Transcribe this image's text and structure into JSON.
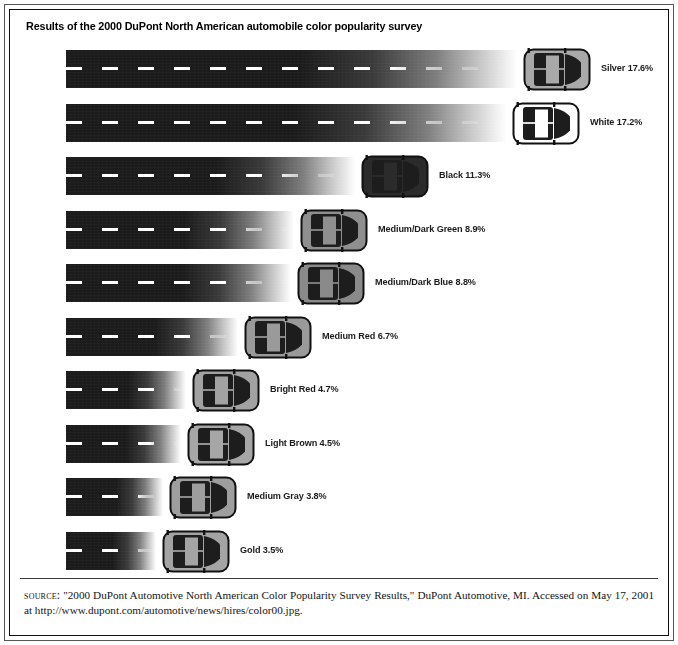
{
  "figure": {
    "title": "Results of the 2000 DuPont North American automobile color popularity survey",
    "source_prefix": "source:",
    "source_text": " \"2000 DuPont Automotive North American Color Popularity Survey Results,\" DuPont Automotive, MI. Accessed on May 17, 2001 at http://www.dupont.com/automotive/news/hires/color00.jpg."
  },
  "chart_data": {
    "type": "bar",
    "title": "Results of the 2000 DuPont North American automobile color popularity survey",
    "xlabel": "",
    "ylabel": "",
    "xlim": [
      0,
      18
    ],
    "grid": false,
    "legend": "none",
    "orientation": "horizontal",
    "unit": "%",
    "categories": [
      "Silver",
      "White",
      "Black",
      "Medium/Dark Green",
      "Medium/Dark Blue",
      "Medium Red",
      "Bright Red",
      "Light Brown",
      "Medium Gray",
      "Gold"
    ],
    "values": [
      17.6,
      17.2,
      11.3,
      8.9,
      8.8,
      6.7,
      4.7,
      4.5,
      3.8,
      3.5
    ],
    "labels": [
      "Silver 17.6%",
      "White 17.2%",
      "Black 11.3%",
      "Medium/Dark Green 8.9%",
      "Medium/Dark Blue 8.8%",
      "Medium Red 6.7%",
      "Bright Red 4.7%",
      "Light Brown 4.5%",
      "Medium Gray 3.8%",
      "Gold 3.5%"
    ],
    "car_colors": [
      "#a9a9a9",
      "#ffffff",
      "#2b2b2b",
      "#8f8f8f",
      "#8a8a8a",
      "#9a9a9a",
      "#a2a2a2",
      "#a6a6a6",
      "#9e9e9e",
      "#a4a4a4"
    ]
  }
}
